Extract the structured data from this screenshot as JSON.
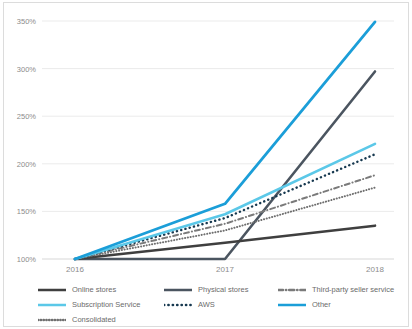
{
  "chart_data": {
    "type": "line",
    "title": "",
    "subtitle": "",
    "xlabel": "",
    "ylabel": "",
    "x": [
      "2016",
      "2017",
      "2018"
    ],
    "categories": [
      "2016",
      "2017",
      "2018"
    ],
    "xlim": [
      2016,
      2018
    ],
    "ylim": [
      100,
      350
    ],
    "yticks": [
      100,
      150,
      200,
      250,
      300,
      350
    ],
    "ytick_labels": [
      "100%",
      "150%",
      "200%",
      "250%",
      "300%",
      "350%"
    ],
    "xtick_labels": [
      "2016",
      "2017",
      "2018"
    ],
    "grid": "horizontal",
    "legend_position": "bottom",
    "series": [
      {
        "name": "Online stores",
        "values": [
          100,
          117,
          135
        ],
        "color": "#3f3f3f",
        "style": "solid",
        "width": 2.6
      },
      {
        "name": "Physical stores",
        "values": [
          100,
          100,
          297
        ],
        "color": "#4b5560",
        "style": "solid",
        "width": 2.6
      },
      {
        "name": "Third-party seller service",
        "values": [
          100,
          137,
          188
        ],
        "color": "#7a7a7a",
        "style": "dashdot",
        "width": 2.0
      },
      {
        "name": "Subscription Service",
        "values": [
          100,
          147,
          221
        ],
        "color": "#5bc8e8",
        "style": "solid",
        "width": 2.6
      },
      {
        "name": "AWS",
        "values": [
          100,
          143,
          210
        ],
        "color": "#16384f",
        "style": "dotted",
        "width": 2.4
      },
      {
        "name": "Other",
        "values": [
          100,
          158,
          349
        ],
        "color": "#1b9ed8",
        "style": "solid",
        "width": 2.8
      },
      {
        "name": "Consolidated",
        "values": [
          100,
          130,
          175
        ],
        "color": "#6f6f6f",
        "style": "finedot",
        "width": 2.0
      }
    ]
  },
  "axes": {
    "y_labels": [
      "350%",
      "300%",
      "250%",
      "200%",
      "150%",
      "100%"
    ],
    "x_labels": [
      "2016",
      "2017",
      "2018"
    ]
  },
  "legend": {
    "items": [
      {
        "label": "Online stores",
        "color": "#3f3f3f",
        "style": "solid"
      },
      {
        "label": "Physical stores",
        "color": "#4b5560",
        "style": "solid"
      },
      {
        "label": "Third-party seller service",
        "color": "#7a7a7a",
        "style": "dashdot"
      },
      {
        "label": "Subscription Service",
        "color": "#5bc8e8",
        "style": "solid"
      },
      {
        "label": "AWS",
        "color": "#16384f",
        "style": "dotted"
      },
      {
        "label": "Other",
        "color": "#1b9ed8",
        "style": "solid"
      },
      {
        "label": "Consolidated",
        "color": "#6f6f6f",
        "style": "finedot"
      }
    ]
  },
  "colors": {
    "grid": "#ebebeb",
    "axis_text": "#8c8c8c",
    "frame": "#dcdcdc",
    "background": "#ffffff"
  }
}
